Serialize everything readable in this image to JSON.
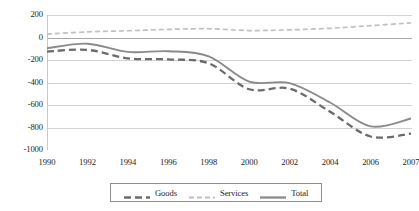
{
  "chart_data": {
    "type": "line",
    "title": "",
    "xlabel": "",
    "ylabel": "",
    "ylim": [
      -1000,
      200
    ],
    "grid": true,
    "legend_position": "bottom",
    "categories": [
      "1990",
      "1992",
      "1994",
      "1996",
      "1998",
      "2000",
      "2002",
      "2004",
      "2006",
      "2007"
    ],
    "x_tick_labels": [
      "1990",
      "1992",
      "1994",
      "1996",
      "1998",
      "2000",
      "2002",
      "2004",
      "2006",
      "2007"
    ],
    "y_tick_labels": [
      "200",
      "0",
      "-200",
      "-400",
      "-600",
      "-800",
      "-1000"
    ],
    "y_tick_values": [
      200,
      0,
      -200,
      -400,
      -600,
      -800,
      -1000
    ],
    "series": [
      {
        "name": "Goods",
        "style": "dashed",
        "color": "#6b6b6b",
        "values": [
          -125,
          -110,
          -185,
          -195,
          -230,
          -460,
          -455,
          -660,
          -880,
          -855
        ]
      },
      {
        "name": "Services",
        "style": "dotted",
        "color": "#c0c0c0",
        "values": [
          30,
          50,
          60,
          72,
          78,
          62,
          68,
          82,
          105,
          130
        ]
      },
      {
        "name": "Total",
        "style": "solid",
        "color": "#8a8a8a",
        "values": [
          -95,
          -55,
          -128,
          -122,
          -168,
          -392,
          -405,
          -578,
          -790,
          -720
        ]
      }
    ],
    "legend": [
      {
        "label": "Goods",
        "style": "dashed",
        "color": "#6b6b6b"
      },
      {
        "label": "Services",
        "style": "dotted",
        "color": "#c0c0c0"
      },
      {
        "label": "Total",
        "style": "solid",
        "color": "#8a8a8a"
      }
    ]
  }
}
